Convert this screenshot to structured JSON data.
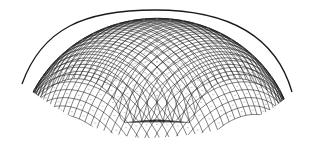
{
  "figure": {
    "background_color": "#ffffff",
    "line_color": "#1a1a1a",
    "outline": {
      "apex": [
        155,
        10
      ],
      "left_tip": [
        22,
        84
      ],
      "right_tip": [
        292,
        92
      ],
      "bottom_low": [
        150,
        138
      ]
    },
    "grid": {
      "families": 2,
      "divisions": 34
    }
  }
}
